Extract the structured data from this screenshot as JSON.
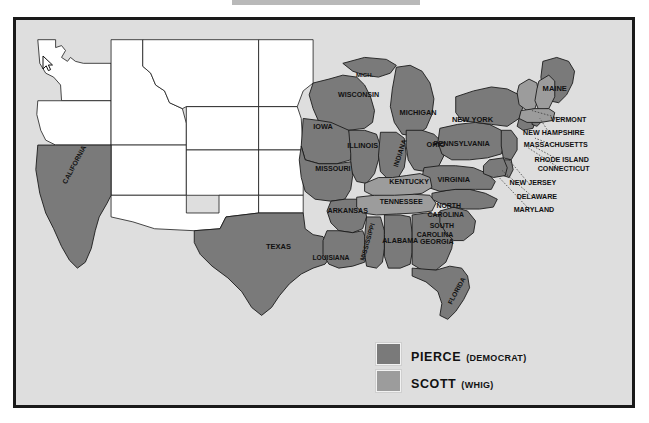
{
  "map": {
    "title": "United States Presidential Election 1852 Results Map",
    "background_color": "#dedede",
    "frame_color": "#1a1a1a",
    "ocean_color": "#dedede",
    "colors": {
      "pierce_democrat": "#7a7a7a",
      "scott_whig": "#9c9c9c",
      "territory_unshaded": "#ffffff",
      "state_border": "#1a1a1a",
      "label_text": "#111111"
    },
    "state_labels": [
      {
        "name": "MICH.",
        "x": 352,
        "y": 58,
        "size": 6.2,
        "rotate": 0
      },
      {
        "name": "WISCONSIN",
        "x": 346,
        "y": 78,
        "size": 7.2,
        "rotate": 0
      },
      {
        "name": "MICHIGAN",
        "x": 406,
        "y": 96,
        "size": 7.4,
        "rotate": 0
      },
      {
        "name": "IOWA",
        "x": 310,
        "y": 111,
        "size": 7.4,
        "rotate": 0
      },
      {
        "name": "ILLINOIS",
        "x": 350,
        "y": 130,
        "size": 7.4,
        "rotate": 0
      },
      {
        "name": "INDIANA",
        "x": 390,
        "y": 136,
        "size": 7.0,
        "rotate": -72
      },
      {
        "name": "OHIO",
        "x": 424,
        "y": 129,
        "size": 7.4,
        "rotate": 0
      },
      {
        "name": "MISSOURI",
        "x": 320,
        "y": 153,
        "size": 7.2,
        "rotate": 0
      },
      {
        "name": "KENTUCKY",
        "x": 397,
        "y": 167,
        "size": 7.2,
        "rotate": 0
      },
      {
        "name": "TENNESSEE",
        "x": 389,
        "y": 187,
        "size": 7.2,
        "rotate": 0
      },
      {
        "name": "ARKANSAS",
        "x": 335,
        "y": 196,
        "size": 7.2,
        "rotate": 0
      },
      {
        "name": "MISSISSIPPI",
        "x": 357,
        "y": 226,
        "size": 6.6,
        "rotate": -74
      },
      {
        "name": "ALABAMA",
        "x": 388,
        "y": 226,
        "size": 7.2,
        "rotate": 0
      },
      {
        "name": "GEORGIA",
        "x": 425,
        "y": 227,
        "size": 7.2,
        "rotate": 0
      },
      {
        "name": "LOUISIANA",
        "x": 318,
        "y": 244,
        "size": 6.8,
        "rotate": 0
      },
      {
        "name": "FLORIDA",
        "x": 447,
        "y": 276,
        "size": 6.8,
        "rotate": -62
      },
      {
        "name": "TEXAS",
        "x": 265,
        "y": 233,
        "size": 7.6,
        "rotate": 0
      },
      {
        "name": "CALIFORNIA",
        "x": 61,
        "y": 148,
        "size": 7.0,
        "rotate": -62
      },
      {
        "name": "NORTH",
        "x": 437,
        "y": 191,
        "size": 7.0,
        "rotate": 0
      },
      {
        "name": "CAROLINA",
        "x": 434,
        "y": 200,
        "size": 7.0,
        "rotate": 0
      },
      {
        "name": "SOUTH",
        "x": 430,
        "y": 211,
        "size": 7.0,
        "rotate": 0
      },
      {
        "name": "CAROLINA",
        "x": 423,
        "y": 220,
        "size": 7.0,
        "rotate": 0
      },
      {
        "name": "VIRGINIA",
        "x": 442,
        "y": 165,
        "size": 7.4,
        "rotate": 0
      },
      {
        "name": "PENNSYLVANIA",
        "x": 450,
        "y": 128,
        "size": 7.4,
        "rotate": 0
      },
      {
        "name": "NEW YORK",
        "x": 461,
        "y": 104,
        "size": 7.6,
        "rotate": 0
      },
      {
        "name": "MAINE",
        "x": 544,
        "y": 72,
        "size": 7.6,
        "rotate": 0
      }
    ],
    "leader_labels": [
      {
        "name": "VERMONT",
        "x": 558,
        "y": 104,
        "anchor_x": 521,
        "anchor_y": 92
      },
      {
        "name": "NEW HAMPSHIRE",
        "x": 543,
        "y": 117,
        "anchor_x": 528,
        "anchor_y": 100
      },
      {
        "name": "MASSACHUSETTS",
        "x": 545,
        "y": 129,
        "anchor_x": 524,
        "anchor_y": 120
      },
      {
        "name": "RHODE ISLAND",
        "x": 551,
        "y": 144,
        "anchor_x": 521,
        "anchor_y": 127
      },
      {
        "name": "CONNECTICUT",
        "x": 553,
        "y": 153,
        "anchor_x": 515,
        "anchor_y": 128
      },
      {
        "name": "NEW JERSEY",
        "x": 522,
        "y": 168,
        "anchor_x": 494,
        "anchor_y": 139
      },
      {
        "name": "DELAWARE",
        "x": 526,
        "y": 182,
        "anchor_x": 489,
        "anchor_y": 152
      },
      {
        "name": "MARYLAND",
        "x": 523,
        "y": 195,
        "anchor_x": 483,
        "anchor_y": 157
      }
    ]
  },
  "legend": {
    "items": [
      {
        "candidate": "PIERCE",
        "party": "(DEMOCRAT)",
        "color": "#7a7a7a"
      },
      {
        "candidate": "SCOTT",
        "party": "(WHIG)",
        "color": "#9c9c9c"
      }
    ]
  }
}
